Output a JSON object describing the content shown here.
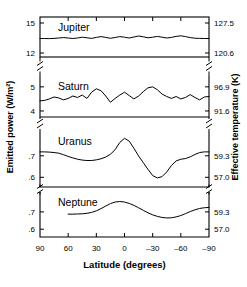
{
  "figure": {
    "xlabel": "Latitude (degrees)",
    "ylabel_left": "Emitted power (W/m²)",
    "ylabel_right": "Effective temperature (K)",
    "xticks": [
      "90",
      "60",
      "30",
      "0",
      "–30",
      "–60",
      "–90"
    ],
    "xtick_values": [
      90,
      60,
      30,
      0,
      -30,
      -60,
      -90
    ],
    "line_color": "#000000",
    "background": "#ffffff"
  },
  "panels": [
    {
      "name": "Jupiter",
      "left_ticks": [
        "15",
        "12"
      ],
      "left_tick_values": [
        15,
        12
      ],
      "right_ticks": [
        "127.5",
        "120.6"
      ],
      "right_tick_values": [
        127.5,
        120.6
      ]
    },
    {
      "name": "Saturn",
      "left_ticks": [
        "5",
        "4"
      ],
      "left_tick_values": [
        5,
        4
      ],
      "right_ticks": [
        "96.9",
        "91.6"
      ],
      "right_tick_values": [
        96.9,
        91.6
      ]
    },
    {
      "name": "Uranus",
      "left_ticks": [
        ".7",
        ".6"
      ],
      "left_tick_values": [
        0.7,
        0.6
      ],
      "right_ticks": [
        "59.3",
        "57.0"
      ],
      "right_tick_values": [
        59.3,
        57.0
      ]
    },
    {
      "name": "Neptune",
      "left_ticks": [
        ".7",
        ".6"
      ],
      "left_tick_values": [
        0.7,
        0.6
      ],
      "right_ticks": [
        "59.3",
        "57.0"
      ],
      "right_tick_values": [
        59.3,
        57.0
      ]
    }
  ],
  "chart_data": {
    "type": "line",
    "title": "",
    "xlabel": "Latitude (degrees)",
    "ylabel": "Emitted power (W/m²)",
    "ylabel_secondary": "Effective temperature (K)",
    "xlim": [
      90,
      -90
    ],
    "grid": false,
    "legend": "none",
    "panel_labels_inside": true,
    "series": [
      {
        "name": "Jupiter",
        "ylabel": "Emitted power (W/m²)",
        "ylim": [
          11.6,
          15.6
        ],
        "yticks": [
          15,
          12
        ],
        "y2label": "Effective temperature (K)",
        "y2ticks": [
          127.5,
          120.6
        ],
        "x": [
          90,
          85,
          80,
          75,
          70,
          65,
          60,
          55,
          50,
          45,
          40,
          35,
          30,
          25,
          20,
          15,
          10,
          5,
          0,
          -5,
          -10,
          -15,
          -20,
          -25,
          -30,
          -35,
          -40,
          -45,
          -50,
          -55,
          -60,
          -65,
          -70,
          -75,
          -80,
          -85,
          -90
        ],
        "values": [
          13.45,
          13.45,
          13.44,
          13.46,
          13.5,
          13.54,
          13.5,
          13.45,
          13.5,
          13.58,
          13.52,
          13.46,
          13.56,
          13.64,
          13.56,
          13.47,
          13.55,
          13.64,
          13.58,
          13.5,
          13.6,
          13.7,
          13.62,
          13.52,
          13.58,
          13.66,
          13.58,
          13.5,
          13.56,
          13.66,
          13.72,
          13.64,
          13.54,
          13.48,
          13.46,
          13.45,
          13.45
        ]
      },
      {
        "name": "Saturn",
        "ylabel": "Emitted power (W/m²)",
        "ylim": [
          3.75,
          5.45
        ],
        "yticks": [
          5,
          4
        ],
        "y2label": "Effective temperature (K)",
        "y2ticks": [
          96.9,
          91.6
        ],
        "x": [
          90,
          85,
          80,
          75,
          70,
          65,
          60,
          55,
          50,
          45,
          40,
          35,
          30,
          25,
          20,
          15,
          10,
          5,
          0,
          -5,
          -10,
          -15,
          -20,
          -25,
          -30,
          -35,
          -40,
          -45,
          -50,
          -55,
          -60,
          -65,
          -70,
          -75,
          -80,
          -85,
          -90
        ],
        "values": [
          4.42,
          4.44,
          4.5,
          4.58,
          4.54,
          4.46,
          4.52,
          4.62,
          4.56,
          4.66,
          4.52,
          4.78,
          4.92,
          4.84,
          4.62,
          4.36,
          4.52,
          4.66,
          4.78,
          4.64,
          4.5,
          4.62,
          4.8,
          4.96,
          5.0,
          4.88,
          4.7,
          4.6,
          4.52,
          4.6,
          4.5,
          4.56,
          4.68,
          4.56,
          4.46,
          4.58,
          4.6
        ]
      },
      {
        "name": "Uranus",
        "ylabel": "Emitted power (W/m²)",
        "ylim": [
          0.555,
          0.815
        ],
        "yticks": [
          0.7,
          0.6
        ],
        "y2label": "Effective temperature (K)",
        "y2ticks": [
          59.3,
          57.0
        ],
        "x": [
          90,
          85,
          80,
          75,
          70,
          65,
          60,
          55,
          50,
          45,
          40,
          35,
          30,
          25,
          20,
          15,
          10,
          5,
          0,
          -5,
          -10,
          -15,
          -20,
          -25,
          -30,
          -35,
          -40,
          -45,
          -50,
          -55,
          -60,
          -65,
          -70,
          -75,
          -80,
          -85,
          -90
        ],
        "values": [
          0.718,
          0.718,
          0.717,
          0.715,
          0.712,
          0.705,
          0.697,
          0.69,
          0.684,
          0.68,
          0.678,
          0.678,
          0.681,
          0.686,
          0.694,
          0.707,
          0.728,
          0.762,
          0.781,
          0.768,
          0.735,
          0.699,
          0.668,
          0.637,
          0.608,
          0.597,
          0.603,
          0.625,
          0.655,
          0.676,
          0.684,
          0.687,
          0.695,
          0.706,
          0.715,
          0.718,
          0.718
        ]
      },
      {
        "name": "Neptune",
        "ylabel": "Emitted power (W/m²)",
        "ylim": [
          0.555,
          0.815
        ],
        "yticks": [
          0.7,
          0.6
        ],
        "y2label": "Effective temperature (K)",
        "y2ticks": [
          59.3,
          57.0
        ],
        "x": [
          60,
          55,
          50,
          45,
          40,
          35,
          30,
          25,
          20,
          15,
          10,
          5,
          0,
          -5,
          -10,
          -15,
          -20,
          -25,
          -30,
          -35,
          -40,
          -45,
          -50,
          -55,
          -60,
          -65,
          -70,
          -75,
          -80,
          -85,
          -90
        ],
        "values": [
          0.687,
          0.687,
          0.688,
          0.689,
          0.692,
          0.697,
          0.706,
          0.719,
          0.734,
          0.748,
          0.757,
          0.76,
          0.757,
          0.749,
          0.738,
          0.724,
          0.709,
          0.695,
          0.683,
          0.674,
          0.668,
          0.665,
          0.666,
          0.671,
          0.679,
          0.69,
          0.702,
          0.712,
          0.72,
          0.724,
          0.726
        ]
      }
    ]
  }
}
